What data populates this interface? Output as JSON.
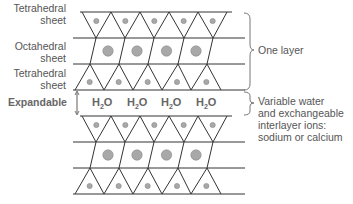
{
  "labels": {
    "tetrahedral_top": [
      "Tetrahedral",
      "sheet"
    ],
    "octahedral": [
      "Octahedral",
      "sheet"
    ],
    "tetrahedral_bottom": [
      "Tetrahedral",
      "sheet"
    ],
    "expandable": "Expandable"
  },
  "water": {
    "molecule": "H",
    "sub": "2",
    "tail": "O",
    "count": 4
  },
  "annotations": {
    "one_layer": "One layer",
    "interlayer": [
      "Variable water",
      "and exchangeable",
      "interlayer ions:",
      "sodium or calcium"
    ]
  },
  "colors": {
    "line": "#333333",
    "atom_fill": "#a8a8a8",
    "atom_stroke": "#888888",
    "text": "#555555"
  }
}
